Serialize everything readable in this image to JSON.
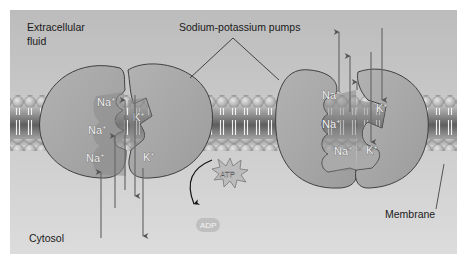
{
  "diagram": {
    "type": "biology-diagram",
    "colors": {
      "panel_top": "#bcbcbc",
      "panel_bottom": "#dadada",
      "protein": "#a9a9a9",
      "pocket": "#8a8a8a",
      "outline": "#3a3a3a",
      "membrane_head": "#c8c8c8",
      "membrane_core": "#707070"
    },
    "labels": {
      "extracellular_line1": "Extracellular",
      "extracellular_line2": "fluid",
      "pumps": "Sodium-potassium pumps",
      "cytosol": "Cytosol",
      "membrane": "Membrane",
      "atp": "ATP",
      "adp": "ADP"
    },
    "left_pump": {
      "ions": [
        {
          "symbol": "Na",
          "charge": "+"
        },
        {
          "symbol": "Na",
          "charge": "+"
        },
        {
          "symbol": "Na",
          "charge": "+"
        },
        {
          "symbol": "K",
          "charge": "+"
        },
        {
          "symbol": "K",
          "charge": "+"
        }
      ]
    },
    "right_pump": {
      "ions": [
        {
          "symbol": "Na",
          "charge": "+"
        },
        {
          "symbol": "Na",
          "charge": "+"
        },
        {
          "symbol": "Na",
          "charge": "+"
        },
        {
          "symbol": "K",
          "charge": "+"
        },
        {
          "symbol": "K",
          "charge": "+"
        }
      ]
    }
  }
}
